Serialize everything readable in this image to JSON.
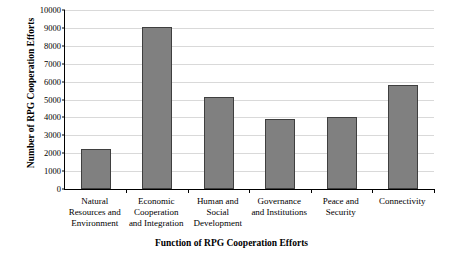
{
  "chart_data": {
    "type": "bar",
    "title": "",
    "xlabel": "Function of RPG Cooperation Efforts",
    "ylabel": "Number of RPG Cooperation Efforts",
    "ylim": [
      0,
      10000
    ],
    "ytick_step": 1000,
    "yticks": [
      "0",
      "1000",
      "2000",
      "3000",
      "4000",
      "5000",
      "6000",
      "7000",
      "8000",
      "9000",
      "10000"
    ],
    "grid": true,
    "legend": "none",
    "categories": [
      "Natural\nResources and\nEnvironment",
      "Economic\nCooperation\nand Integration",
      "Human and\nSocial\nDevelopment",
      "Governance\nand Institutions",
      "Peace and\nSecurity",
      "Connectivity"
    ],
    "values": [
      2250,
      9050,
      5150,
      3900,
      4000,
      5800
    ],
    "bar_color": "#808080",
    "bar_border_color": "#3f3f3f"
  }
}
